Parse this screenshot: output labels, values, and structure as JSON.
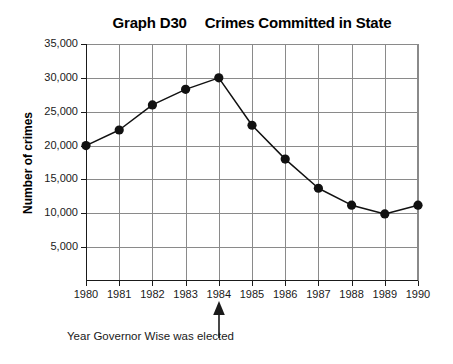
{
  "chart_data": {
    "type": "line",
    "title": "Graph D30   Crimes Committed in State",
    "title_parts": {
      "label": "Graph D30",
      "subject": "Crimes Committed in State"
    },
    "xlabel": "",
    "ylabel": "Number of crimes",
    "categories": [
      "1980",
      "1981",
      "1982",
      "1983",
      "1984",
      "1985",
      "1986",
      "1987",
      "1988",
      "1989",
      "1990"
    ],
    "x": [
      1980,
      1981,
      1982,
      1983,
      1984,
      1985,
      1986,
      1987,
      1988,
      1989,
      1990
    ],
    "values": [
      20000,
      22300,
      26000,
      28300,
      30000,
      23000,
      18000,
      13700,
      11200,
      9900,
      11200
    ],
    "ylim": [
      0,
      35000
    ],
    "ytick_values": [
      5000,
      10000,
      15000,
      20000,
      25000,
      30000,
      35000
    ],
    "ytick_labels": [
      "5,000",
      "10,000",
      "15,000",
      "20,000",
      "25,000",
      "30,000",
      "35,000"
    ],
    "grid": true,
    "legend": null,
    "marker": "filled-circle",
    "line_color": "#111111",
    "marker_color": "#111111",
    "grid_color": "#8a8a8a",
    "axis_color": "#1a1a1a",
    "background": "#ffffff",
    "annotations": [
      {
        "text": "Year Governor Wise was elected",
        "points_to": "1984",
        "arrow": "up-arrow-icon"
      }
    ]
  },
  "annotation": {
    "caption": "Year Governor Wise was elected"
  }
}
